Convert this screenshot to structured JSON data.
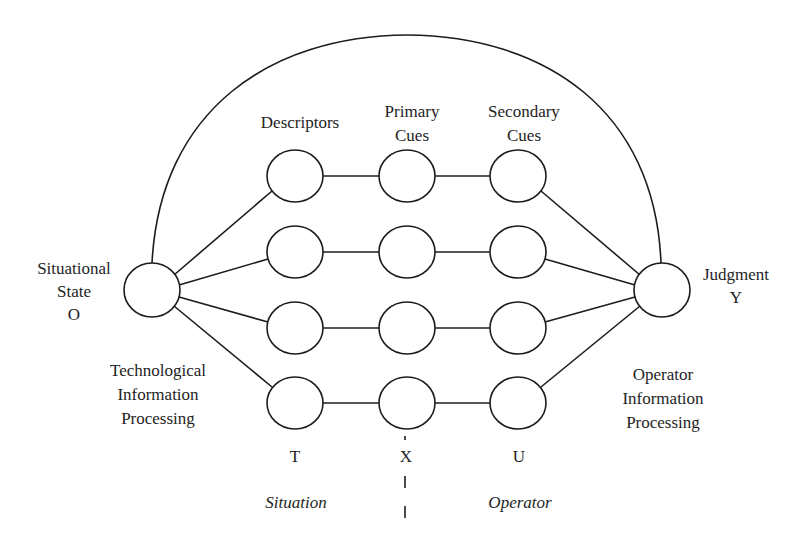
{
  "diagram": {
    "type": "lens-model network",
    "colors": {
      "line": "#1c1c1c",
      "text": "#1e1e1e",
      "background": "#ffffff"
    },
    "column_headers": {
      "descriptors": [
        "Descriptors"
      ],
      "primary_cues": [
        "Primary",
        "Cues"
      ],
      "secondary_cues": [
        "Secondary",
        "Cues"
      ]
    },
    "left_node": {
      "label_lines": [
        "Situational",
        "State",
        "O"
      ]
    },
    "right_node": {
      "label_lines": [
        "Judgment",
        "Y"
      ]
    },
    "left_process": {
      "label_lines": [
        "Technological",
        "Information",
        "Processing"
      ]
    },
    "right_process": {
      "label_lines": [
        "Operator",
        "Information",
        "Processing"
      ]
    },
    "column_variables": {
      "descriptors": "T",
      "primary_cues": "X",
      "secondary_cues": "U"
    },
    "side_labels": {
      "left": "Situation",
      "right": "Operator"
    },
    "rows": 4,
    "columns": [
      "Descriptors",
      "Primary Cues",
      "Secondary Cues"
    ]
  }
}
